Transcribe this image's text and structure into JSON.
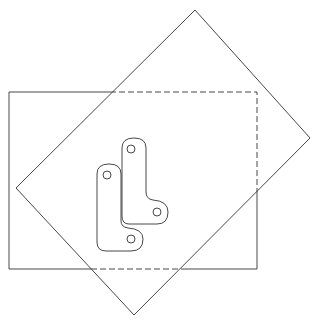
{
  "diagram": {
    "title": "",
    "line_color": "#333333",
    "background": "#ffffff",
    "rotated_square": {
      "top": [
        195,
        10
      ],
      "right": [
        310,
        138
      ],
      "bottom": [
        134,
        315
      ],
      "left": [
        16,
        188
      ]
    },
    "rectangle": {
      "x": 9,
      "y": 92,
      "width": 248,
      "height": 177
    },
    "parts": [
      {
        "name": "left-l-bracket",
        "holes": [
          [
            107,
            175
          ],
          [
            131,
            239
          ]
        ]
      },
      {
        "name": "right-l-bracket",
        "holes": [
          [
            131,
            149
          ],
          [
            157,
            212
          ]
        ]
      }
    ]
  }
}
